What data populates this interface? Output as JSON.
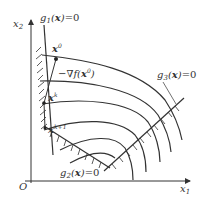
{
  "diagram": {
    "axes": {
      "x_label": "x",
      "x_sub": "1",
      "y_label": "x",
      "y_sub": "2",
      "origin_label": "O"
    },
    "constraints": [
      {
        "name": "g",
        "sub": "1",
        "arg": "x",
        "rhs": "=0"
      },
      {
        "name": "g",
        "sub": "2",
        "arg": "x",
        "rhs": "=0"
      },
      {
        "name": "g",
        "sub": "3",
        "arg": "x",
        "rhs": "=0"
      }
    ],
    "points": [
      {
        "label": "x",
        "sup": "0"
      },
      {
        "label": "x",
        "sup": "k"
      },
      {
        "label": "x",
        "sup": "k+1"
      }
    ],
    "gradient_label": {
      "prefix": "−∇",
      "func": "f",
      "arg": "x",
      "sup": "0"
    },
    "colors": {
      "line": "#333333",
      "background": "#ffffff"
    }
  }
}
